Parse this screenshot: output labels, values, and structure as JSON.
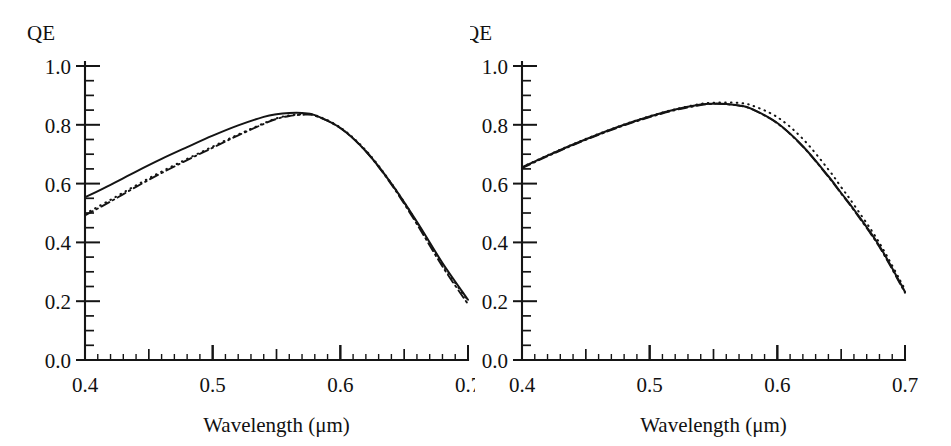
{
  "figure": {
    "panels": [
      {
        "id": "left",
        "name": "quantum-efficiency-panel-left",
        "corner_label": "QE",
        "xlabel": "Wavelength (μm)",
        "ylabel": "QE",
        "xticks": [
          "0.4",
          "0.5",
          "0.6",
          "0.7"
        ],
        "yticks": [
          "0.0",
          "0.2",
          "0.4",
          "0.6",
          "0.8",
          "1.0"
        ]
      },
      {
        "id": "right",
        "name": "quantum-efficiency-panel-right",
        "corner_label": "QE",
        "xlabel": "Wavelength (μm)",
        "ylabel": "QE",
        "xticks": [
          "0.4",
          "0.5",
          "0.6",
          "0.7"
        ],
        "yticks": [
          "0.0",
          "0.2",
          "0.4",
          "0.6",
          "0.8",
          "1.0"
        ]
      }
    ]
  },
  "chart_data": [
    {
      "type": "line",
      "id": "left",
      "title": "",
      "xlabel": "Wavelength (μm)",
      "ylabel": "QE",
      "xlim": [
        0.4,
        0.7
      ],
      "ylim": [
        0.0,
        1.0
      ],
      "xticks": [
        0.4,
        0.5,
        0.6,
        0.7
      ],
      "yticks": [
        0.0,
        0.2,
        0.4,
        0.6,
        0.8,
        1.0
      ],
      "xtick_labels": [
        "0.4",
        "0.5",
        "0.6",
        "0.7"
      ],
      "ytick_labels": [
        "0.0",
        "0.2",
        "0.4",
        "0.6",
        "0.8",
        "1.0"
      ],
      "minor_tick_step": 0.01,
      "mid_tick_step": 0.05,
      "grid": false,
      "legend": "none",
      "x": [
        0.4,
        0.42,
        0.44,
        0.46,
        0.48,
        0.5,
        0.52,
        0.54,
        0.55,
        0.56,
        0.57,
        0.58,
        0.6,
        0.62,
        0.64,
        0.66,
        0.68,
        0.7
      ],
      "series": [
        {
          "name": "solid",
          "style": "solid",
          "values": [
            0.553,
            0.596,
            0.641,
            0.684,
            0.724,
            0.763,
            0.798,
            0.827,
            0.836,
            0.84,
            0.84,
            0.833,
            0.789,
            0.71,
            0.6,
            0.47,
            0.33,
            0.205
          ]
        },
        {
          "name": "dash-dot",
          "style": "dashdot",
          "values": [
            0.492,
            0.539,
            0.589,
            0.636,
            0.68,
            0.722,
            0.764,
            0.803,
            0.82,
            0.83,
            0.834,
            0.831,
            0.789,
            0.71,
            0.597,
            0.462,
            0.318,
            0.19
          ]
        },
        {
          "name": "dotted",
          "style": "dotted",
          "values": [
            0.497,
            0.545,
            0.594,
            0.641,
            0.684,
            0.726,
            0.767,
            0.805,
            0.822,
            0.832,
            0.836,
            0.833,
            0.791,
            0.713,
            0.601,
            0.468,
            0.326,
            0.2
          ]
        }
      ]
    },
    {
      "type": "line",
      "id": "right",
      "title": "",
      "xlabel": "Wavelength (μm)",
      "ylabel": "QE",
      "xlim": [
        0.4,
        0.7
      ],
      "ylim": [
        0.0,
        1.0
      ],
      "xticks": [
        0.4,
        0.5,
        0.6,
        0.7
      ],
      "yticks": [
        0.0,
        0.2,
        0.4,
        0.6,
        0.8,
        1.0
      ],
      "xtick_labels": [
        "0.4",
        "0.5",
        "0.6",
        "0.7"
      ],
      "ytick_labels": [
        "0.0",
        "0.2",
        "0.4",
        "0.6",
        "0.8",
        "1.0"
      ],
      "minor_tick_step": 0.01,
      "mid_tick_step": 0.05,
      "grid": false,
      "legend": "none",
      "x": [
        0.4,
        0.42,
        0.44,
        0.46,
        0.48,
        0.5,
        0.52,
        0.54,
        0.55,
        0.56,
        0.57,
        0.58,
        0.6,
        0.62,
        0.64,
        0.65,
        0.66,
        0.68,
        0.7
      ],
      "series": [
        {
          "name": "solid",
          "style": "solid",
          "values": [
            0.655,
            0.695,
            0.733,
            0.768,
            0.8,
            0.828,
            0.852,
            0.869,
            0.872,
            0.871,
            0.866,
            0.854,
            0.806,
            0.727,
            0.625,
            0.568,
            0.512,
            0.388,
            0.232
          ]
        },
        {
          "name": "dashed",
          "style": "dashdot",
          "values": [
            0.653,
            0.693,
            0.731,
            0.766,
            0.798,
            0.826,
            0.85,
            0.867,
            0.871,
            0.87,
            0.865,
            0.853,
            0.805,
            0.726,
            0.623,
            0.566,
            0.509,
            0.384,
            0.229
          ]
        },
        {
          "name": "dotted",
          "style": "dotted",
          "values": [
            0.656,
            0.696,
            0.734,
            0.769,
            0.801,
            0.829,
            0.853,
            0.871,
            0.875,
            0.876,
            0.874,
            0.866,
            0.826,
            0.752,
            0.648,
            0.588,
            0.528,
            0.398,
            0.24
          ]
        }
      ]
    }
  ]
}
